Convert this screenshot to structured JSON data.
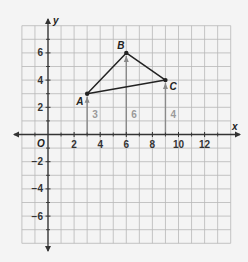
{
  "graph": {
    "x_axis_label": "x",
    "y_axis_label": "y",
    "origin_label": "O",
    "x_range": [
      -2,
      14
    ],
    "y_range": [
      -8,
      8
    ],
    "grid_step": 1,
    "x_tick_labels": [
      "2",
      "4",
      "6",
      "8",
      "10",
      "12"
    ],
    "x_tick_values": [
      2,
      4,
      6,
      8,
      10,
      12
    ],
    "y_tick_labels": [
      "6",
      "4",
      "2",
      "-2",
      "-4",
      "-6"
    ],
    "y_tick_values": [
      6,
      4,
      2,
      -2,
      -4,
      -6
    ]
  },
  "triangle": {
    "points": [
      {
        "name": "A",
        "x": 3,
        "y": 3
      },
      {
        "name": "B",
        "x": 6,
        "y": 6
      },
      {
        "name": "C",
        "x": 9,
        "y": 4
      }
    ]
  },
  "height_segments": [
    {
      "x": 3,
      "height": 3,
      "label": "3"
    },
    {
      "x": 6,
      "height": 6,
      "label": "6"
    },
    {
      "x": 9,
      "height": 4,
      "label": "4"
    }
  ],
  "colors": {
    "background": "#f4f4f4",
    "grid": "#b8b8b8",
    "axis": "#333333",
    "triangle": "#222222",
    "height_segment": "#8a8a8a",
    "segment_label": "#9a9a9a"
  }
}
